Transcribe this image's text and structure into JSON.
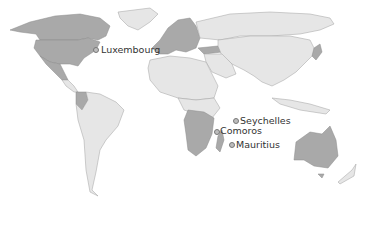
{
  "map": {
    "type": "choropleth world map",
    "legend": null,
    "colors": {
      "highlighted": "#a9a9a9",
      "other": "#e6e6e6",
      "ocean": "#ffffff"
    },
    "highlighted_regions": [
      "United States",
      "Canada",
      "Mexico",
      "Western Europe",
      "Turkey",
      "Colombia",
      "Southern Africa (several)",
      "Madagascar",
      "Australia",
      "Japan"
    ],
    "callouts": [
      {
        "name": "Luxembourg",
        "x": 96,
        "y": 50
      },
      {
        "name": "Seychelles",
        "x": 235,
        "y": 121
      },
      {
        "name": "Comoros",
        "x": 216,
        "y": 131
      },
      {
        "name": "Mauritius",
        "x": 230,
        "y": 144
      }
    ]
  }
}
